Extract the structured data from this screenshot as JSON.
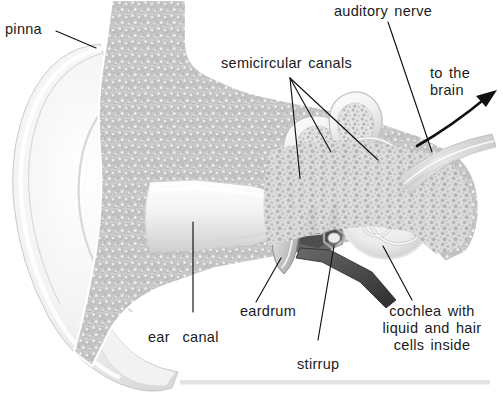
{
  "figure": {
    "background_color": "#ffffff",
    "text_color": "#1a1a1a",
    "bone_color": "#c6c6c6",
    "tissue_color": "#e8e8e8",
    "cavity_color": "#4f4f4f",
    "leader_color": "#111111"
  },
  "labels": {
    "pinna": "pinna",
    "semicircular_canals": "semicircular canals",
    "auditory_nerve": "auditory nerve",
    "to_the_brain": "to the\nbrain",
    "ear_canal": "ear  canal",
    "eardrum": "eardrum",
    "stirrup": "stirrup",
    "cochlea": "cochlea with\nliquid and hair\ncells inside"
  },
  "parts": [
    {
      "id": "pinna",
      "label": "pinna",
      "leader": true
    },
    {
      "id": "semicircular-canals",
      "label": "semicircular canals",
      "leader": true
    },
    {
      "id": "auditory-nerve",
      "label": "auditory nerve",
      "leader": true
    },
    {
      "id": "to-the-brain",
      "label": "to the brain",
      "leader": false
    },
    {
      "id": "ear-canal",
      "label": "ear canal",
      "leader": true
    },
    {
      "id": "eardrum",
      "label": "eardrum",
      "leader": true
    },
    {
      "id": "stirrup",
      "label": "stirrup",
      "leader": true
    },
    {
      "id": "cochlea",
      "label": "cochlea with liquid and hair cells inside",
      "leader": true
    }
  ]
}
